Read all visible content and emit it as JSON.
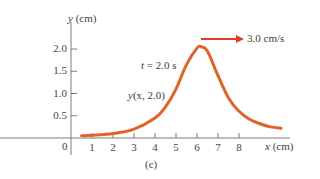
{
  "chart_data": {
    "type": "line",
    "title": "",
    "panel_label": "(c)",
    "xlabel": "x (cm)",
    "ylabel": "y (cm)",
    "xlim": [
      0,
      10.5
    ],
    "ylim": [
      0,
      2.6
    ],
    "x_ticks": [
      "1",
      "2",
      "3",
      "4",
      "5",
      "6",
      "7",
      "8"
    ],
    "y_ticks": [
      "0.5",
      "1.0",
      "1.5",
      "2.0"
    ],
    "origin_label": "0",
    "grid": false,
    "legend": null,
    "series": [
      {
        "name": "y(x, 2.0)",
        "color": "#e0632a",
        "x": [
          0.5,
          1.0,
          2.0,
          3.0,
          4.0,
          4.5,
          5.0,
          5.5,
          6.0,
          6.2,
          6.5,
          7.0,
          7.5,
          8.0,
          8.5,
          9.0,
          9.5,
          10.0
        ],
        "y": [
          0.05,
          0.06,
          0.1,
          0.2,
          0.45,
          0.7,
          1.1,
          1.65,
          2.02,
          2.05,
          1.95,
          1.4,
          0.9,
          0.6,
          0.42,
          0.32,
          0.25,
          0.22
        ]
      }
    ],
    "annotations": [
      {
        "text": "t = 2.0 s",
        "x": 4.1,
        "y": 1.95
      },
      {
        "text": "y(x, 2.0)",
        "x": 3.1,
        "y": 1.0
      },
      {
        "text": "3.0 cm/s",
        "type": "arrow",
        "direction": "right",
        "color": "#e8392b",
        "x_start": 6.2,
        "x_end": 8.2,
        "y": 2.2
      }
    ]
  }
}
